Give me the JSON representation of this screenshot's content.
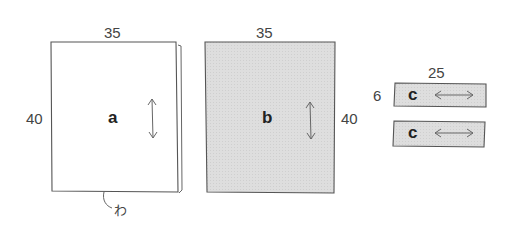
{
  "pieces": [
    {
      "id": "a",
      "label": "a",
      "width": "35",
      "height": "40",
      "fill": "#ffffff",
      "grain": "vertical",
      "fold_label": "わ"
    },
    {
      "id": "b",
      "label": "b",
      "width": "35",
      "height": "40",
      "fill": "#dcdcdc",
      "grain": "vertical"
    },
    {
      "id": "c1",
      "label": "c",
      "width": "25",
      "height": "6",
      "fill": "#dcdcdc",
      "grain": "horizontal"
    },
    {
      "id": "c2",
      "label": "c",
      "fill": "#dcdcdc",
      "grain": "horizontal"
    }
  ],
  "colors": {
    "stroke": "#555555",
    "shade": "#dcdcdc"
  }
}
